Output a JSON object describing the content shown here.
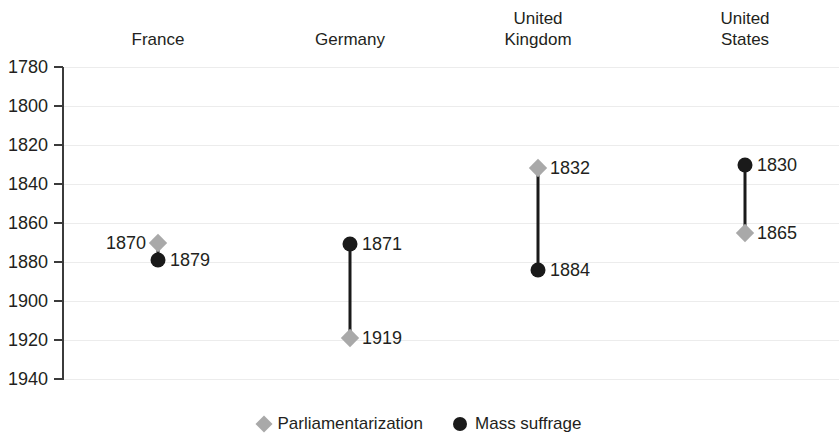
{
  "chart_data": {
    "type": "scatter",
    "title": "",
    "subtitle": "",
    "xlabel": "",
    "ylabel": "",
    "ylim": [
      1780,
      1940
    ],
    "y_inverted": true,
    "grid": true,
    "legend_position": "bottom",
    "categories": [
      "France",
      "Germany",
      "United Kingdom",
      "United States"
    ],
    "y_ticks": [
      1780,
      1800,
      1820,
      1840,
      1860,
      1880,
      1900,
      1920,
      1940
    ],
    "series": [
      {
        "name": "Parliamentarization",
        "marker": "diamond",
        "color": "#a9a9a9",
        "values": [
          1870,
          1919,
          1832,
          1865
        ]
      },
      {
        "name": "Mass suffrage",
        "marker": "circle",
        "color": "#1a1a1a",
        "values": [
          1879,
          1871,
          1884,
          1830
        ]
      }
    ],
    "points": [
      {
        "category": "France",
        "series": "Parliamentarization",
        "value": 1870,
        "label": "1870",
        "label_side": "left",
        "marker": "diamond"
      },
      {
        "category": "France",
        "series": "Mass suffrage",
        "value": 1879,
        "label": "1879",
        "label_side": "right",
        "marker": "circle"
      },
      {
        "category": "Germany",
        "series": "Mass suffrage",
        "value": 1871,
        "label": "1871",
        "label_side": "right",
        "marker": "circle"
      },
      {
        "category": "Germany",
        "series": "Parliamentarization",
        "value": 1919,
        "label": "1919",
        "label_side": "right",
        "marker": "diamond"
      },
      {
        "category": "United Kingdom",
        "series": "Parliamentarization",
        "value": 1832,
        "label": "1832",
        "label_side": "right",
        "marker": "diamond"
      },
      {
        "category": "United Kingdom",
        "series": "Mass suffrage",
        "value": 1884,
        "label": "1884",
        "label_side": "right",
        "marker": "circle"
      },
      {
        "category": "United States",
        "series": "Mass suffrage",
        "value": 1830,
        "label": "1830",
        "label_side": "right",
        "marker": "circle"
      },
      {
        "category": "United States",
        "series": "Parliamentarization",
        "value": 1865,
        "label": "1865",
        "label_side": "right",
        "marker": "diamond"
      }
    ]
  },
  "headers": [
    {
      "label": "France",
      "lines": 1
    },
    {
      "label": "Germany",
      "lines": 1
    },
    {
      "label": "United\nKingdom",
      "lines": 2
    },
    {
      "label": "United\nStates",
      "lines": 2
    }
  ],
  "axis": {
    "ticks": [
      "1780",
      "1800",
      "1820",
      "1840",
      "1860",
      "1880",
      "1900",
      "1920",
      "1940"
    ]
  },
  "legend": {
    "items": [
      {
        "label": "Parliamentarization",
        "marker": "diamond",
        "color": "#a9a9a9"
      },
      {
        "label": "Mass suffrage",
        "marker": "circle",
        "color": "#1a1a1a"
      }
    ]
  },
  "colors": {
    "parliamentarization": "#a9a9a9",
    "mass_suffrage": "#1a1a1a",
    "axis": "#3b3b3b",
    "grid": "#ececec",
    "text": "#231f20"
  }
}
